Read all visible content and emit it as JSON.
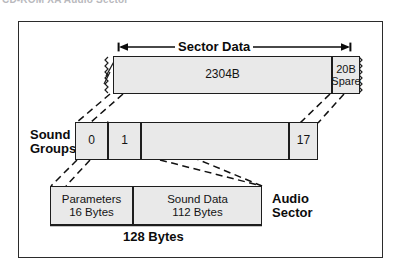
{
  "figure": {
    "clipped_heading": "CD-ROM XA Audio Sector",
    "dimension_label": "Sector Data",
    "bottom_caption": "128 Bytes"
  },
  "sector_row": {
    "data_block_label": "2304B",
    "spare_block": {
      "line1": "20B",
      "line2": "Spare"
    }
  },
  "sound_groups_row": {
    "row_label_line1": "Sound",
    "row_label_line2": "Groups",
    "cells": [
      {
        "label": "0"
      },
      {
        "label": "1"
      },
      {
        "label": ""
      },
      {
        "label": "17"
      }
    ]
  },
  "audio_sector_row": {
    "row_label_line1": "Audio",
    "row_label_line2": "Sector",
    "cells": [
      {
        "line1": "Parameters",
        "line2": "16 Bytes"
      },
      {
        "line1": "Sound Data",
        "line2": "112 Bytes"
      }
    ]
  },
  "colors": {
    "fill": "#e9e9e9",
    "stroke": "#1d1d1d",
    "frame": "#2b2b2b",
    "text": "#0c0c0c",
    "background": "#ffffff"
  }
}
